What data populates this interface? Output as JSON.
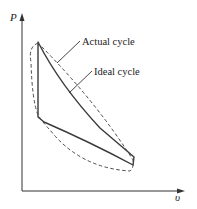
{
  "diagram": {
    "type": "pv-diagram",
    "axes": {
      "y_label": "P",
      "x_label": "υ"
    },
    "annotations": [
      {
        "id": "actual",
        "label": "Actual cycle",
        "style": "dashed"
      },
      {
        "id": "ideal",
        "label": "Ideal cycle",
        "style": "solid"
      }
    ],
    "colors": {
      "line": "#3a3a3a",
      "axis": "#333333",
      "background": "#ffffff"
    }
  }
}
